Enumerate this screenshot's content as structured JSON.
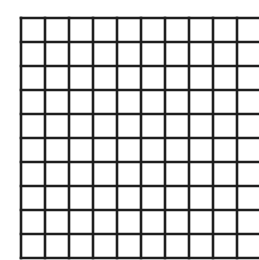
{
  "diagram": {
    "type": "square-grid",
    "rows": 10,
    "columns": 10,
    "origin_x": 21,
    "origin_y": 18,
    "cell_size": 24,
    "line_width": 2.6,
    "line_color": "#1e1e1e",
    "background": "#ffffff"
  }
}
